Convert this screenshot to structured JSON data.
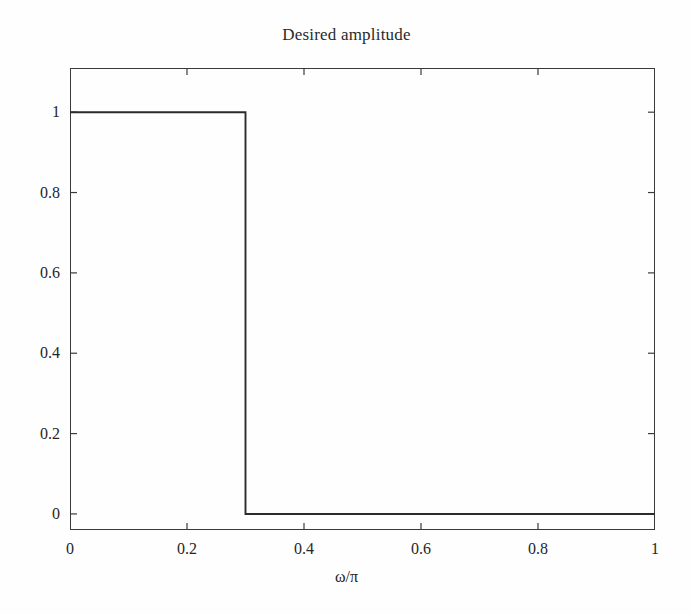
{
  "chart_data": {
    "type": "line",
    "title": "Desired amplitude",
    "xlabel": "ω/π",
    "ylabel": "",
    "xlim": [
      0,
      1
    ],
    "ylim": [
      -0.04,
      1.11
    ],
    "grid": false,
    "legend": null,
    "xticks": [
      "0",
      "0.2",
      "0.4",
      "0.6",
      "0.8",
      "1"
    ],
    "xtick_values": [
      0,
      0.2,
      0.4,
      0.6,
      0.8,
      1
    ],
    "yticks": [
      "0",
      "0.2",
      "0.4",
      "0.6",
      "0.8",
      "1"
    ],
    "ytick_values": [
      0,
      0.2,
      0.4,
      0.6,
      0.8,
      1
    ],
    "series": [
      {
        "name": "Desired amplitude",
        "color": "#2b2b2b",
        "x": [
          0,
          0.3,
          0.3,
          1
        ],
        "values": [
          1,
          1,
          0,
          0
        ]
      }
    ],
    "annotations": []
  },
  "axes": {
    "line_color": "#3a3a3a",
    "tick_color": "#3a3a3a",
    "tick_direction": "in",
    "frame": "box"
  }
}
